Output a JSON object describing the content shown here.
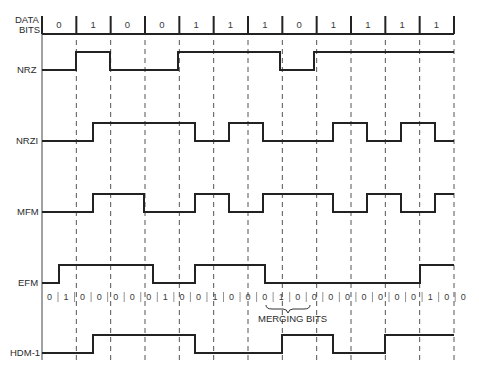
{
  "diagram": {
    "title_label_line1": "DATA",
    "title_label_line2": "BITS",
    "data_bits": [
      "0",
      "1",
      "0",
      "0",
      "1",
      "1",
      "1",
      "0",
      "1",
      "1",
      "1",
      "1"
    ],
    "signals": [
      {
        "name": "NRZ",
        "label": "NRZ"
      },
      {
        "name": "NRZI",
        "label": "NRZI"
      },
      {
        "name": "MFM",
        "label": "MFM"
      },
      {
        "name": "EFM",
        "label": "EFM"
      },
      {
        "name": "HDM-1",
        "label": "HDM-1"
      }
    ],
    "efm_channel_bits": [
      "0",
      "1",
      "0",
      "0",
      "0",
      "0",
      "0",
      "1",
      "0",
      "0",
      "1",
      "0",
      "0",
      "0",
      "1",
      "0",
      "0",
      "0",
      "0",
      "0",
      "0",
      "0",
      "0",
      "1",
      "0",
      "0"
    ],
    "merging_bits_label": "MERGING BITS"
  }
}
